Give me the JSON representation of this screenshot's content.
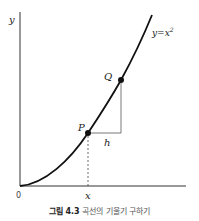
{
  "figure": {
    "axis_labels": {
      "y": "y",
      "x": "x",
      "origin": "0"
    },
    "curve_label": "y = x²",
    "curve_label_base": "y=x",
    "curve_label_sup": "2",
    "points": [
      {
        "name": "P",
        "x": 88,
        "y": 133
      },
      {
        "name": "Q",
        "x": 121,
        "y": 80
      }
    ],
    "increment_label": "h",
    "caption": {
      "number": "그림 4.3",
      "text": "곡선의 기울기 구하기"
    },
    "colors": {
      "curve": "#111111",
      "axes": "#333333",
      "triangle": "#555555",
      "text": "#222222"
    }
  }
}
